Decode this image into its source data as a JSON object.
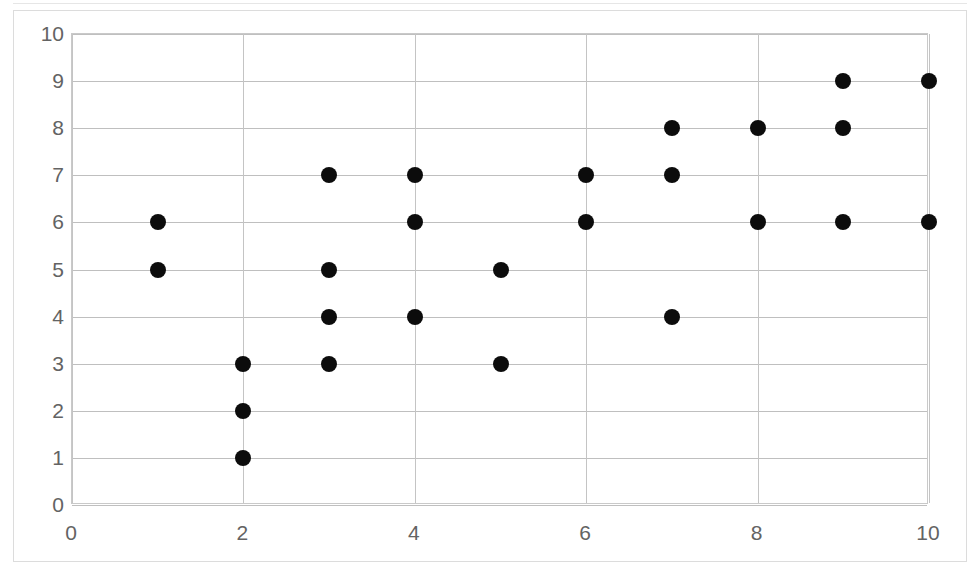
{
  "chart_data": {
    "type": "scatter",
    "title": "",
    "xlabel": "",
    "ylabel": "",
    "xlim": [
      0,
      10
    ],
    "ylim": [
      0,
      10
    ],
    "grid": true,
    "legend": null,
    "x_ticks": [
      0,
      2,
      4,
      6,
      8,
      10
    ],
    "y_ticks": [
      0,
      1,
      2,
      3,
      4,
      5,
      6,
      7,
      8,
      9,
      10
    ],
    "x_gridlines": [
      0,
      2,
      4,
      6,
      8,
      10
    ],
    "y_gridlines": [
      0,
      1,
      2,
      3,
      4,
      5,
      6,
      7,
      8,
      9,
      10
    ],
    "marker": {
      "shape": "circle",
      "color": "#0c0c0c",
      "size_px": 16
    },
    "point_count": 24,
    "points": [
      {
        "x": 1,
        "y": 6
      },
      {
        "x": 1,
        "y": 5
      },
      {
        "x": 2,
        "y": 3
      },
      {
        "x": 2,
        "y": 2
      },
      {
        "x": 2,
        "y": 1
      },
      {
        "x": 3,
        "y": 7
      },
      {
        "x": 3,
        "y": 5
      },
      {
        "x": 3,
        "y": 4
      },
      {
        "x": 3,
        "y": 3
      },
      {
        "x": 4,
        "y": 7
      },
      {
        "x": 4,
        "y": 6
      },
      {
        "x": 4,
        "y": 4
      },
      {
        "x": 5,
        "y": 5
      },
      {
        "x": 5,
        "y": 3
      },
      {
        "x": 6,
        "y": 7
      },
      {
        "x": 6,
        "y": 6
      },
      {
        "x": 7,
        "y": 8
      },
      {
        "x": 7,
        "y": 7
      },
      {
        "x": 7,
        "y": 4
      },
      {
        "x": 8,
        "y": 8
      },
      {
        "x": 8,
        "y": 6
      },
      {
        "x": 9,
        "y": 9
      },
      {
        "x": 9,
        "y": 8
      },
      {
        "x": 9,
        "y": 6
      },
      {
        "x": 10,
        "y": 9
      },
      {
        "x": 10,
        "y": 6
      }
    ],
    "series": [
      {
        "name": "",
        "x": [
          1,
          1,
          2,
          2,
          2,
          3,
          3,
          3,
          3,
          4,
          4,
          4,
          5,
          5,
          6,
          6,
          7,
          7,
          7,
          8,
          8,
          9,
          9,
          9,
          10,
          10
        ],
        "y": [
          6,
          5,
          3,
          2,
          1,
          7,
          5,
          4,
          3,
          7,
          6,
          4,
          5,
          3,
          7,
          6,
          8,
          7,
          4,
          8,
          6,
          9,
          8,
          6,
          9,
          6
        ]
      }
    ]
  },
  "colors": {
    "marker": "#0c0c0c",
    "gridline": "#bfbfbf",
    "plot_border": "#c9c9c9",
    "tick_label": "#636363",
    "background": "#ffffff"
  }
}
